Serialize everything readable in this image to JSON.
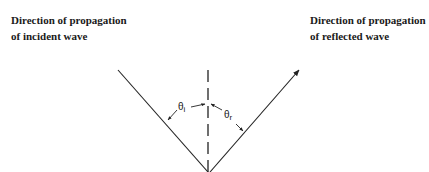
{
  "labels": {
    "incident_line1": "Direction of propagation",
    "incident_line2": "of incident wave",
    "reflected_line1": "Direction of propagation",
    "reflected_line2": "of reflected wave"
  },
  "angles": {
    "incident_symbol": "θ",
    "incident_subscript": "i",
    "reflected_symbol": "θ",
    "reflected_subscript": "r"
  },
  "colors": {
    "line": "#222222",
    "background": "#ffffff"
  }
}
